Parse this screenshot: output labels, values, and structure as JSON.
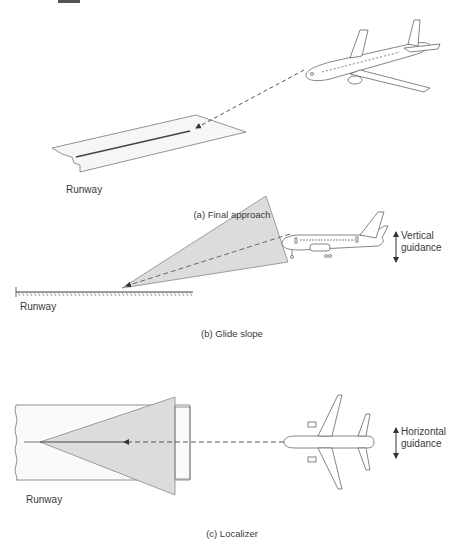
{
  "header_fragment": "...y...",
  "panels": [
    {
      "id": "a",
      "caption": "(a) Final approach",
      "runway_label": "Runway"
    },
    {
      "id": "b",
      "caption": "(b) Glide slope",
      "runway_label": "Runway",
      "guidance_label_line1": "Vertical",
      "guidance_label_line2": "guidance"
    },
    {
      "id": "c",
      "caption": "(c) Localizer",
      "runway_label": "Runway",
      "guidance_label_line1": "Horizontal",
      "guidance_label_line2": "guidance"
    }
  ],
  "colors": {
    "line": "#555555",
    "beam_fill": "#d9d9d9",
    "runway_fill": "#f4f4f4",
    "text": "#3a3a3a"
  }
}
